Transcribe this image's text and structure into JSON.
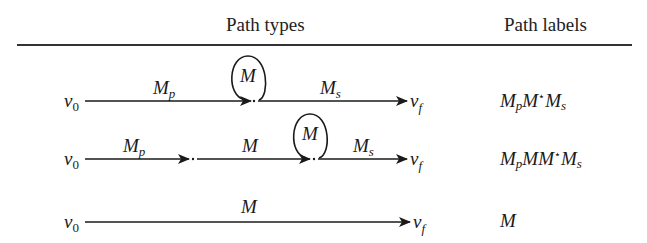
{
  "header": {
    "col_path_types": "Path types",
    "col_path_labels": "Path labels"
  },
  "rows": [
    {
      "start": "v0",
      "end": "vf",
      "segments": [
        {
          "label": "Mp",
          "type": "edge"
        },
        {
          "label": "M",
          "type": "self-loop"
        },
        {
          "label": "Ms",
          "type": "edge"
        }
      ],
      "path_label": {
        "parts": [
          "M",
          "p",
          "M",
          "⋆",
          "M",
          "s"
        ],
        "text": "MpM*Ms"
      }
    },
    {
      "start": "v0",
      "end": "vf",
      "segments": [
        {
          "label": "Mp",
          "type": "edge"
        },
        {
          "label": "M",
          "type": "edge"
        },
        {
          "label": "M",
          "type": "self-loop"
        },
        {
          "label": "Ms",
          "type": "edge"
        }
      ],
      "path_label": {
        "parts": [
          "M",
          "p",
          "M",
          "M",
          "⋆",
          "M",
          "s"
        ],
        "text": "MpMM*Ms"
      }
    },
    {
      "start": "v0",
      "end": "vf",
      "segments": [
        {
          "label": "M",
          "type": "edge"
        }
      ],
      "path_label": {
        "parts": [
          "M"
        ],
        "text": "M"
      }
    }
  ],
  "symbols": {
    "v": "v",
    "sub0": "0",
    "subf": "f",
    "M": "M",
    "p": "p",
    "s": "s",
    "star": "⋆"
  }
}
